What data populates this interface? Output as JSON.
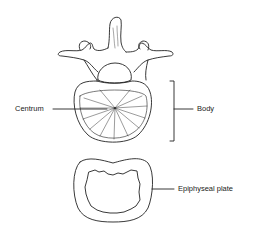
{
  "figure": {
    "labels": {
      "centrum": "Centrum",
      "body": "Body",
      "epiphyseal_plate": "Epiphyseal plate"
    }
  }
}
